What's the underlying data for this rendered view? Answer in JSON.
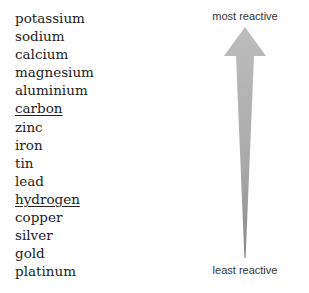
{
  "metals": [
    {
      "name": "potassium",
      "underlined": false
    },
    {
      "name": "sodium",
      "underlined": false
    },
    {
      "name": "calcium",
      "underlined": false
    },
    {
      "name": "magnesium",
      "underlined": false
    },
    {
      "name": "aluminium",
      "underlined": false
    },
    {
      "name": "carbon",
      "underlined": true
    },
    {
      "name": "zinc",
      "underlined": false
    },
    {
      "name": "iron",
      "underlined": false
    },
    {
      "name": "tin",
      "underlined": false
    },
    {
      "name": "lead",
      "underlined": false
    },
    {
      "name": "hydrogen",
      "underlined": true
    },
    {
      "name": "copper",
      "underlined": false
    },
    {
      "name": "silver",
      "underlined": false
    },
    {
      "name": "gold",
      "underlined": false
    },
    {
      "name": "platinum",
      "underlined": false
    }
  ],
  "arrow": {
    "top_label": "most reactive",
    "bottom_label": "least reactive",
    "icon": "up-arrow-icon",
    "color_top": "#b8b8b8",
    "color_bottom": "#8a8a8a"
  }
}
